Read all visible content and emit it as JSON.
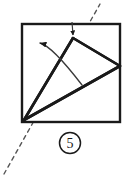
{
  "figure": {
    "kind": "origami-fold-step-diagram",
    "step_label": "5",
    "step_label_style": "circled-number",
    "stroke_color": "#1a1a1a",
    "fill_color": "#ffffff",
    "background_color": "#ffffff",
    "sheet": {
      "name": "square-sheet",
      "shape": "square",
      "x": 22,
      "y": 24,
      "width": 98,
      "height": 98
    },
    "fold_crease_lines": [
      {
        "name": "crease-corner-to-apex",
        "from": [
          24,
          120
        ],
        "to": [
          73,
          38
        ]
      },
      {
        "name": "crease-corner-to-right-vertex",
        "from": [
          24,
          120
        ],
        "to": [
          120,
          66
        ]
      },
      {
        "name": "crease-apex-to-right-vertex",
        "from": [
          73,
          38
        ],
        "to": [
          120,
          66
        ]
      }
    ],
    "dashed_axis": {
      "name": "fold-axis-dashed-line",
      "from": [
        4,
        174
      ],
      "to": [
        100,
        4
      ],
      "dash_pattern": "4 4"
    },
    "motion_arrow": {
      "name": "fold-direction-arrow",
      "type": "curved-arrow",
      "arc_start": [
        82,
        85
      ],
      "arc_control": [
        52,
        46
      ],
      "arc_end": [
        40,
        43
      ],
      "arrow_tip": [
        30,
        43
      ],
      "direction": "counter-clockwise-up-left"
    },
    "apex_marker": {
      "name": "apex-down-arrow",
      "type": "short-straight-arrow",
      "from": [
        72,
        22
      ],
      "to": [
        73,
        37
      ],
      "direction": "down"
    }
  }
}
